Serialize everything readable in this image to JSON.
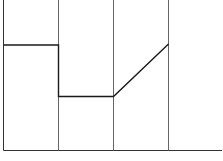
{
  "diagram": {
    "type": "piecewise-line-over-grid",
    "frame": {
      "left": 3.5,
      "bottom": 150.5,
      "right": 222,
      "top": 0
    },
    "column_dividers_x": [
      58.5,
      113.5,
      168.5
    ],
    "line_points": [
      [
        3.5,
        45
      ],
      [
        58.5,
        45
      ],
      [
        58.5,
        96.5
      ],
      [
        113.5,
        96.5
      ],
      [
        168.5,
        44
      ]
    ],
    "colors": {
      "line": "#1a1a1a",
      "grid": "#555555",
      "background": "#ffffff"
    }
  }
}
